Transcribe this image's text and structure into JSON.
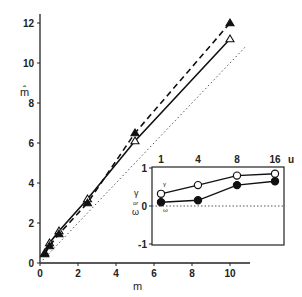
{
  "chart_data": [
    {
      "type": "line",
      "title": "",
      "xlabel": "m",
      "ylabel": "m̂",
      "xlim": [
        0,
        11
      ],
      "ylim": [
        0,
        12.5
      ],
      "xticks": [
        0,
        2,
        4,
        6,
        8,
        10
      ],
      "yticks": [
        0,
        2,
        4,
        6,
        8,
        10,
        12
      ],
      "grid": false,
      "series": [
        {
          "name": "identity",
          "style": "dotted",
          "marker": "none",
          "x": [
            0,
            10.8
          ],
          "y": [
            0,
            10.8
          ]
        },
        {
          "name": "open markers (solid line)",
          "style": "solid",
          "marker": "open-triangle",
          "x": [
            0.25,
            0.5,
            1,
            2.5,
            5,
            10
          ],
          "y": [
            0.5,
            1.0,
            1.6,
            3.2,
            6.1,
            11.2
          ]
        },
        {
          "name": "filled markers (dashed line)",
          "style": "dashed",
          "marker": "filled-triangle",
          "x": [
            0.25,
            0.5,
            1,
            2.5,
            5,
            10
          ],
          "y": [
            0.45,
            0.85,
            1.45,
            3.0,
            6.5,
            12.0
          ]
        }
      ]
    },
    {
      "type": "line",
      "title": "inset",
      "xlabel": "u",
      "ylabel": "γ or ω",
      "categories": [
        "1",
        "4",
        "8",
        "16"
      ],
      "ylim": [
        -1,
        1
      ],
      "yticks": [
        -1,
        0,
        1
      ],
      "grid": false,
      "reference_line": {
        "y": 0,
        "style": "dotted"
      },
      "series": [
        {
          "name": "γ",
          "marker": "open-circle",
          "values": [
            0.32,
            0.55,
            0.8,
            0.85
          ]
        },
        {
          "name": "ω",
          "marker": "filled-circle",
          "values": [
            0.1,
            0.15,
            0.55,
            0.65
          ]
        }
      ]
    }
  ],
  "labels": {
    "main_xlabel": "m",
    "main_ylabel": "m̂",
    "main_xticks": [
      "0",
      "2",
      "4",
      "6",
      "8",
      "10"
    ],
    "main_yticks": [
      "0",
      "2",
      "4",
      "6",
      "8",
      "10",
      "12"
    ],
    "inset_xlabel": "u",
    "inset_xticks": [
      "1",
      "4",
      "8",
      "16"
    ],
    "inset_yticks": [
      "1",
      "0",
      "-1"
    ],
    "inset_ylabel_top": "γ",
    "inset_ylabel_mid": "or",
    "inset_ylabel_bot": "ω",
    "inset_series_gamma": "γ",
    "inset_series_omega": "ω"
  }
}
